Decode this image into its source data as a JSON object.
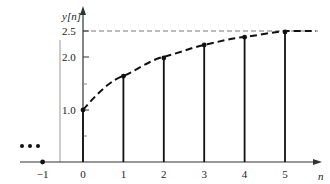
{
  "chart_data": {
    "type": "stem",
    "title": "",
    "xlabel": "n",
    "ylabel": "y[n]",
    "x": [
      -1,
      0,
      1,
      2,
      3,
      4,
      5
    ],
    "values": [
      0,
      1.0,
      1.65,
      2.0,
      2.25,
      2.4,
      2.5
    ],
    "xticks": [
      "−1",
      "0",
      "1",
      "2",
      "3",
      "4",
      "5"
    ],
    "yticks": [
      "1.0",
      "2.0",
      "2.5"
    ],
    "ytick_values": [
      1.0,
      2.0,
      2.5
    ],
    "asymptote": 2.5,
    "envelope": "dashed curve through stem tops approaching 2.5",
    "annotations": [
      "•••"
    ],
    "ylim": [
      0,
      2.7
    ],
    "xlim": [
      -1.5,
      5.8
    ],
    "grid": false
  },
  "colors": {
    "stem": "#111111",
    "axis": "#333333",
    "guide": "#888888"
  }
}
